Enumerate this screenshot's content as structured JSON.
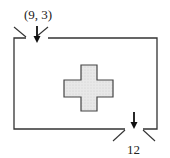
{
  "diagram": {
    "entry_label": "(9, 3)",
    "exit_label": "12",
    "colors": {
      "stroke": "#333333",
      "obstacle_fill": "#e6e6e6",
      "background": "#ffffff"
    },
    "shapes": {
      "room": "rectangular enclosure with entry gap top-left and exit gap bottom-right",
      "obstacle": "plus-shaped cross in center",
      "entry_arrow": "arrow pointing down into room",
      "exit_arrow": "arrow pointing down out of room"
    }
  }
}
